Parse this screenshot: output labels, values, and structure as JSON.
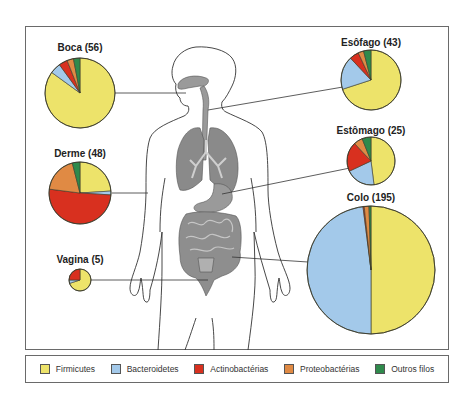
{
  "colors": {
    "firmicutes": "#ede36a",
    "bacteroidetes": "#a3c9ea",
    "actinobacterias": "#d8301f",
    "proteobacterias": "#e08a44",
    "outros": "#2f8a4c",
    "organ_fill": "#8c8c8c",
    "organ_light": "#b5b5b5",
    "outline": "#333333"
  },
  "legend": [
    {
      "key": "firmicutes",
      "label": "Firmicutes"
    },
    {
      "key": "bacteroidetes",
      "label": "Bacteroidetes"
    },
    {
      "key": "actinobacterias",
      "label": "Actinobactérias"
    },
    {
      "key": "proteobacterias",
      "label": "Proteobactérias"
    },
    {
      "key": "outros",
      "label": "Outros filos"
    }
  ],
  "chart_data": {
    "type": "pie",
    "title": "",
    "series_order": [
      "firmicutes",
      "bacteroidetes",
      "actinobacterias",
      "proteobacterias",
      "outros"
    ],
    "pies": [
      {
        "name": "Boca",
        "n": 56,
        "title": "Boca (56)",
        "values": {
          "firmicutes": 85,
          "bacteroidetes": 5,
          "actinobacterias": 4,
          "proteobacterias": 3,
          "outros": 3
        }
      },
      {
        "name": "Esôfago",
        "n": 43,
        "title": "Esôfago (43)",
        "values": {
          "firmicutes": 70,
          "bacteroidetes": 18,
          "actinobacterias": 5,
          "proteobacterias": 3,
          "outros": 4
        }
      },
      {
        "name": "Estômago",
        "n": 25,
        "title": "Estômago (25)",
        "values": {
          "firmicutes": 48,
          "bacteroidetes": 20,
          "actinobacterias": 20,
          "proteobacterias": 6,
          "outros": 6
        }
      },
      {
        "name": "Derme",
        "n": 48,
        "title": "Derme (48)",
        "values": {
          "firmicutes": 24,
          "bacteroidetes": 2,
          "actinobacterias": 51,
          "proteobacterias": 19,
          "outros": 4
        }
      },
      {
        "name": "Colo",
        "n": 195,
        "title": "Colo (195)",
        "values": {
          "firmicutes": 50,
          "bacteroidetes": 48,
          "actinobacterias": 0.3,
          "proteobacterias": 1.2,
          "outros": 0.5
        }
      },
      {
        "name": "Vagina",
        "n": 5,
        "title": "Vagina (5)",
        "values": {
          "firmicutes": 70,
          "bacteroidetes": 5,
          "actinobacterias": 25,
          "proteobacterias": 0,
          "outros": 0
        }
      }
    ]
  }
}
